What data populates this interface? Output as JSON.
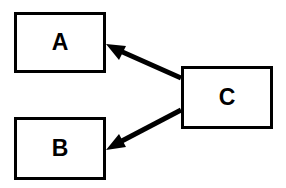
{
  "diagram": {
    "title": "",
    "background_color": "#ffffff",
    "stroke_color": "#000000",
    "border_width_px": 3,
    "nodes": [
      {
        "id": "a",
        "label": "A",
        "x": 14,
        "y": 12,
        "width": 92,
        "height": 61
      },
      {
        "id": "b",
        "label": "B",
        "x": 14,
        "y": 117,
        "width": 92,
        "height": 63
      },
      {
        "id": "c",
        "label": "C",
        "x": 181,
        "y": 66,
        "width": 92,
        "height": 63
      }
    ],
    "edges": [
      {
        "id": "c-to-a",
        "from": "c",
        "to": "a",
        "direction": "one-way",
        "arrowhead_at": "a",
        "start_x": 181,
        "start_y": 78,
        "end_x": 107,
        "end_y": 45
      },
      {
        "id": "c-to-b",
        "from": "c",
        "to": "b",
        "direction": "one-way",
        "arrowhead_at": "b",
        "start_x": 181,
        "start_y": 110,
        "end_x": 107,
        "end_y": 149
      }
    ]
  }
}
